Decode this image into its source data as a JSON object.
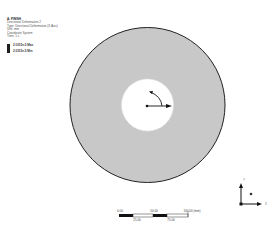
{
  "legend": {
    "title": "A: FINISH",
    "lines": [
      "Directional Deformation 2",
      "Type: Directional Deformation (X Axis)",
      "Unit: mm",
      "Coordinate System",
      "Time: 1 s"
    ],
    "max_label": "2.0315e-5 Max",
    "min_label": "2.0315e-5 Min",
    "swatch_color": "#1e1e1e"
  },
  "model": {
    "shape": "annulus",
    "fill_color": "#c8c8c8",
    "edge_color": "#222222",
    "hole_color": "#ffffff",
    "center": [
      147.5,
      105
    ],
    "outer_radius": 77.5,
    "inner_radius": 26
  },
  "coordinate_marker": {
    "origin": [
      147,
      106
    ],
    "x_arrow_end": [
      171,
      106
    ],
    "rotation_arc": "counter-clockwise"
  },
  "scale_bar": {
    "top_labels": [
      "0.00",
      "50.00",
      "100.00 (mm)"
    ],
    "bottom_labels": [
      "25.00",
      "75.00"
    ]
  },
  "triad": {
    "x_label": "X",
    "y_label": "Y"
  }
}
